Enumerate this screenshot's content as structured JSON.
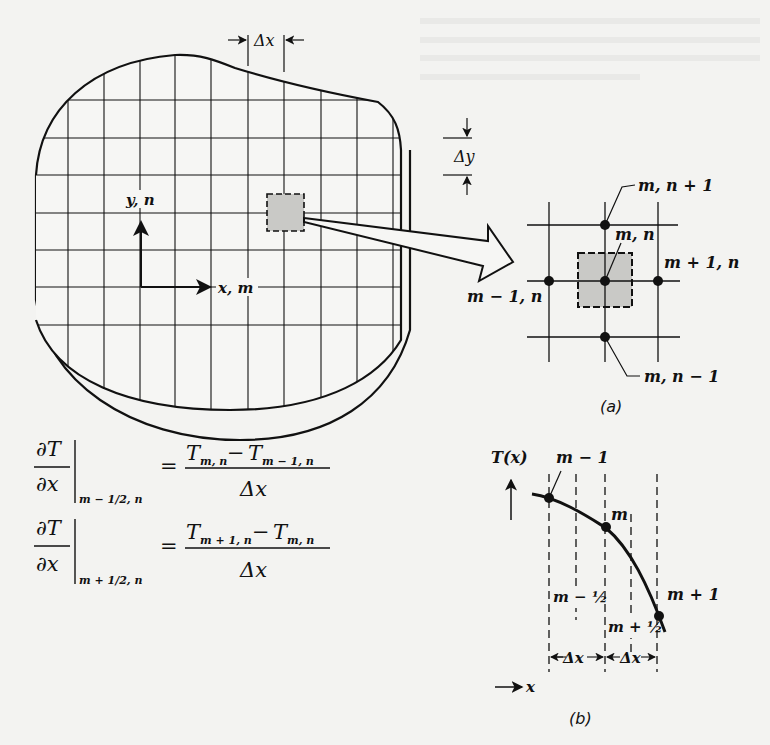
{
  "figure": {
    "part_a": {
      "caption": "(a)",
      "dx_label": "Δx",
      "dy_label": "Δy",
      "axis_y_label": "y, n",
      "axis_x_label": "x, m",
      "nodes": {
        "top": "m, n + 1",
        "center": "m, n",
        "right": "m + 1, n",
        "left": "m − 1, n",
        "bottom": "m, n − 1"
      }
    },
    "equations": [
      {
        "lhs_num": "∂T",
        "lhs_den": "∂x",
        "eval_at": "m − 1/2, n",
        "rhs_num_a": "T",
        "rhs_num_a_sub": "m, n",
        "rhs_num_minus": " − ",
        "rhs_num_b": "T",
        "rhs_num_b_sub": "m − 1, n",
        "rhs_den": "Δx",
        "equals": "="
      },
      {
        "lhs_num": "∂T",
        "lhs_den": "∂x",
        "eval_at": "m + 1/2, n",
        "rhs_num_a": "T",
        "rhs_num_a_sub": "m + 1, n",
        "rhs_num_minus": " − ",
        "rhs_num_b": "T",
        "rhs_num_b_sub": "m, n",
        "rhs_den": "Δx",
        "equals": "="
      }
    ],
    "part_b": {
      "caption": "(b)",
      "y_axis_label": "T(x)",
      "x_axis_label": "x",
      "points": {
        "prev": "m − 1",
        "curr": "m",
        "next": "m + 1"
      },
      "half_left": "m − ½",
      "half_right": "m + ½",
      "dx_left": "Δx",
      "dx_right": "Δx"
    },
    "colors": {
      "ink": "#111111",
      "paper": "#f3f3f1",
      "shaded_cell": "#c9c9c6"
    }
  }
}
